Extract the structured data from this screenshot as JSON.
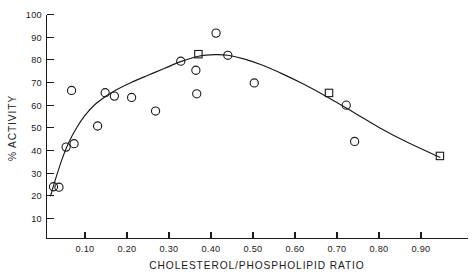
{
  "chart_data": {
    "type": "scatter",
    "title": "",
    "subtitle": "",
    "xlabel": "CHOLESTEROL/PHOSPHOLIPID RATIO",
    "ylabel": "% ACTIVITY",
    "xlim": [
      0.0,
      0.97
    ],
    "ylim": [
      0,
      100
    ],
    "grid": false,
    "legend": "none",
    "xticks": [
      "0.10",
      "0.20",
      "0.30",
      "0.40",
      "0.50",
      "0.60",
      "0.70",
      "0.80",
      "0.90"
    ],
    "xtick_values": [
      0.1,
      0.2,
      0.3,
      0.4,
      0.5,
      0.6,
      0.7,
      0.8,
      0.9
    ],
    "yticks": [
      "10",
      "20",
      "30",
      "40",
      "50",
      "60",
      "70",
      "80",
      "90",
      "100"
    ],
    "ytick_values": [
      10,
      20,
      30,
      40,
      50,
      60,
      70,
      80,
      90,
      100
    ],
    "series": [
      {
        "name": "open-circle-samples",
        "marker": "open-circle",
        "points": [
          {
            "x": 0.025,
            "y": 24.0
          },
          {
            "x": 0.038,
            "y": 23.8
          },
          {
            "x": 0.055,
            "y": 41.5
          },
          {
            "x": 0.068,
            "y": 66.5
          },
          {
            "x": 0.074,
            "y": 43.0
          },
          {
            "x": 0.13,
            "y": 50.8
          },
          {
            "x": 0.148,
            "y": 65.5
          },
          {
            "x": 0.17,
            "y": 64.0
          },
          {
            "x": 0.211,
            "y": 63.4
          },
          {
            "x": 0.268,
            "y": 57.4
          },
          {
            "x": 0.328,
            "y": 79.4
          },
          {
            "x": 0.364,
            "y": 75.4
          },
          {
            "x": 0.366,
            "y": 65.0
          },
          {
            "x": 0.412,
            "y": 91.8
          },
          {
            "x": 0.44,
            "y": 82.0
          },
          {
            "x": 0.503,
            "y": 69.8
          },
          {
            "x": 0.722,
            "y": 60.0
          },
          {
            "x": 0.742,
            "y": 44.0
          }
        ]
      },
      {
        "name": "open-square-samples",
        "marker": "open-square",
        "points": [
          {
            "x": 0.37,
            "y": 82.5
          },
          {
            "x": 0.681,
            "y": 65.4
          },
          {
            "x": 0.945,
            "y": 37.6
          }
        ]
      },
      {
        "name": "fitted-curve",
        "marker": "line",
        "points": [
          {
            "x": 0.018,
            "y": 20.0
          },
          {
            "x": 0.03,
            "y": 27.5
          },
          {
            "x": 0.045,
            "y": 36.0
          },
          {
            "x": 0.06,
            "y": 43.0
          },
          {
            "x": 0.08,
            "y": 50.0
          },
          {
            "x": 0.1,
            "y": 55.5
          },
          {
            "x": 0.125,
            "y": 60.5
          },
          {
            "x": 0.15,
            "y": 64.0
          },
          {
            "x": 0.175,
            "y": 66.8
          },
          {
            "x": 0.21,
            "y": 70.0
          },
          {
            "x": 0.25,
            "y": 73.2
          },
          {
            "x": 0.29,
            "y": 76.3
          },
          {
            "x": 0.328,
            "y": 79.2
          },
          {
            "x": 0.37,
            "y": 81.6
          },
          {
            "x": 0.41,
            "y": 82.3
          },
          {
            "x": 0.44,
            "y": 82.0
          },
          {
            "x": 0.48,
            "y": 80.3
          },
          {
            "x": 0.52,
            "y": 77.8
          },
          {
            "x": 0.57,
            "y": 73.8
          },
          {
            "x": 0.62,
            "y": 69.3
          },
          {
            "x": 0.681,
            "y": 63.2
          },
          {
            "x": 0.74,
            "y": 56.8
          },
          {
            "x": 0.8,
            "y": 50.2
          },
          {
            "x": 0.87,
            "y": 43.4
          },
          {
            "x": 0.945,
            "y": 37.0
          }
        ]
      }
    ]
  },
  "axes": {
    "y_axis_label": "% ACTIVITY",
    "x_axis_label": "CHOLESTEROL/PHOSPHOLIPID RATIO"
  }
}
